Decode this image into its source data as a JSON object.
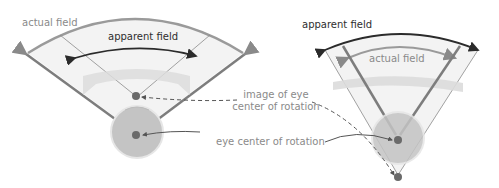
{
  "left_diagram": {
    "label_actual_field": "actual field",
    "label_apparent_field": "apparent field"
  },
  "right_diagram": {
    "label_apparent_field": "apparent field",
    "label_actual_field": "actual field"
  },
  "callouts": {
    "image_of_eye_line1": "image of eye",
    "image_of_eye_line2": "center of rotation",
    "eye_center": "eye center of rotation"
  },
  "colors": {
    "field_fill": "#f3f3f3",
    "arc_gray": "#9a9a9a",
    "arrow_dark": "#2b2b2b",
    "ray_gray": "#7d7d7d",
    "lens_fill": "#dcdcdc",
    "eye_fill": "#c4c4c4",
    "eye_outline": "#e2e2e2",
    "pupil": "#6a6a6a"
  }
}
